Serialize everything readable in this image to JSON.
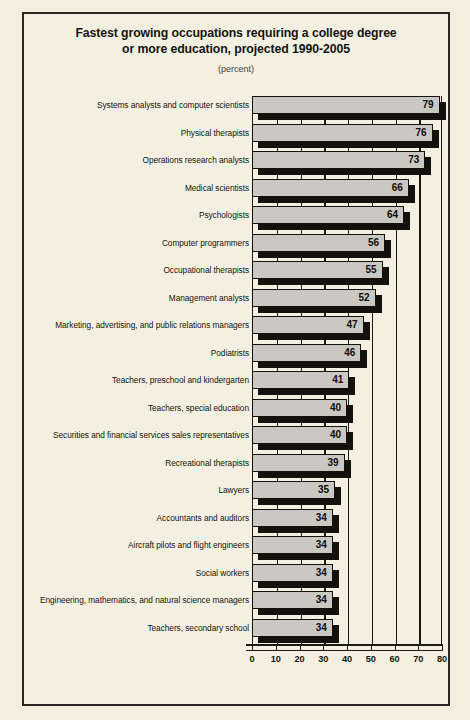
{
  "title": {
    "line1": "Fastest growing occupations requiring a college degree",
    "line2": "or more education, projected 1990-2005",
    "subtitle": "(percent)"
  },
  "chart_data": {
    "type": "bar",
    "orientation": "horizontal",
    "title": "Fastest growing occupations requiring a college degree or more education, projected 1990-2005",
    "subtitle": "(percent)",
    "xlabel": "",
    "ylabel": "",
    "xlim": [
      0,
      80
    ],
    "xticks": [
      0,
      10,
      20,
      30,
      40,
      50,
      60,
      70,
      80
    ],
    "xtick_labels": [
      "0",
      "10",
      "20",
      "30",
      "40",
      "50",
      "60",
      "70",
      "80"
    ],
    "grid": true,
    "grid_axis": "x",
    "legend": false,
    "bar_style": "3d-extruded",
    "bar_face_color": "#c9c8c2",
    "bar_shadow_color": "#15120d",
    "categories": [
      "Systems analysts and computer scientists",
      "Physical therapists",
      "Operations research analysts",
      "Medical scientists",
      "Psychologists",
      "Computer programmers",
      "Occupational therapists",
      "Management analysts",
      "Marketing, advertising, and public relations managers",
      "Podiatrists",
      "Teachers, preschool and kindergarten",
      "Teachers, special education",
      "Securities and financial services sales representatives",
      "Recreational therapists",
      "Lawyers",
      "Accountants and auditors",
      "Aircraft pilots and flight engineers",
      "Social workers",
      "Engineering, mathematics, and natural science managers",
      "Teachers, secondary school"
    ],
    "values": [
      79,
      76,
      73,
      66,
      64,
      56,
      55,
      52,
      47,
      46,
      41,
      40,
      40,
      39,
      35,
      34,
      34,
      34,
      34,
      34
    ],
    "value_labels": [
      "79",
      "76",
      "73",
      "66",
      "64",
      "56",
      "55",
      "52",
      "47",
      "46",
      "41",
      "40",
      "40",
      "39",
      "35",
      "34",
      "34",
      "34",
      "34",
      "34"
    ]
  },
  "colors": {
    "page_background": "#f2efdf",
    "frame_border": "#2b2722",
    "ink": "#17140f",
    "bar_face": "#c9c8c2",
    "bar_shadow": "#15120d"
  }
}
